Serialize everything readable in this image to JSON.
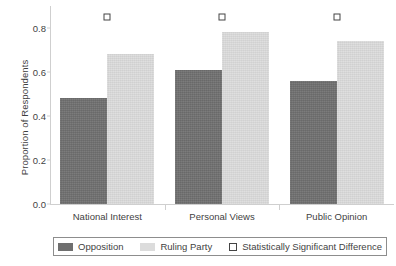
{
  "chart_data": {
    "type": "bar",
    "title": "",
    "subtitle": "",
    "xlabel": "",
    "ylabel": "Proportion of Respondents",
    "categories": [
      "National Interest",
      "Personal Views",
      "Public Opinion"
    ],
    "series": [
      {
        "name": "Opposition",
        "color": "#6f6f6f",
        "values": [
          0.48,
          0.61,
          0.56
        ]
      },
      {
        "name": "Ruling Party",
        "color": "#dcdcdc",
        "values": [
          0.68,
          0.78,
          0.74
        ]
      }
    ],
    "ylim": [
      0.0,
      0.88
    ],
    "yticks": [
      0.0,
      0.2,
      0.4,
      0.6,
      0.8
    ],
    "ytick_labels": [
      "0.0",
      "0.2",
      "0.4",
      "0.6",
      "0.8"
    ],
    "grid": false,
    "legend_position": "bottom",
    "annotations": {
      "name": "Statistically Significant Difference",
      "marker": "open-square",
      "y": 0.85,
      "groups": [
        "National Interest",
        "Personal Views",
        "Public Opinion"
      ]
    }
  },
  "axis": {
    "y_title": "Proportion of Respondents",
    "y_ticks": [
      "0.8",
      "0.6",
      "0.4",
      "0.2",
      "0.0"
    ]
  },
  "categories": {
    "c0": "National Interest",
    "c1": "Personal Views",
    "c2": "Public Opinion"
  },
  "legend": {
    "opposition": "Opposition",
    "ruling": "Ruling Party",
    "significance": "Statistically Significant Difference"
  },
  "colors": {
    "opposition": "#6f6f6f",
    "ruling_party": "#dcdcdc",
    "marker_edge": "#444444",
    "axis": "#cfcfcf",
    "text": "#3f3f3f",
    "background": "#ffffff"
  }
}
